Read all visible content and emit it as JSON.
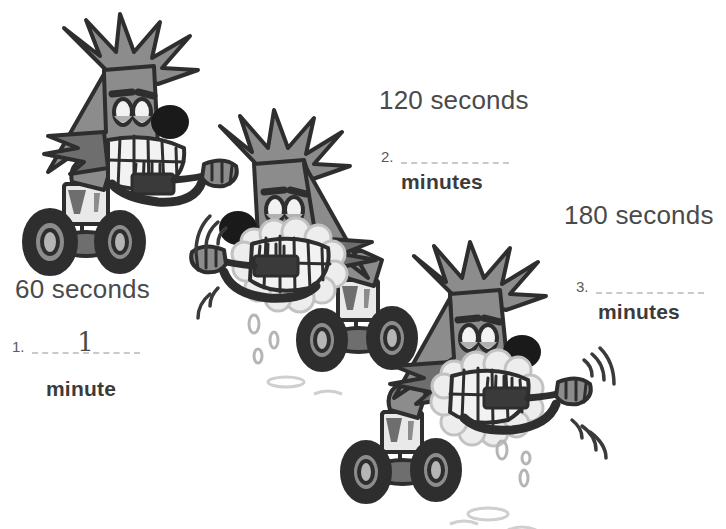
{
  "worksheet": {
    "background_color": "#ffffff",
    "text_color": "#4a4a4a",
    "palette": {
      "body_gray": "#8c8c8c",
      "body_shadow": "#6e6e6e",
      "dark_gray": "#5a5a5a",
      "outline": "#2e2e2e",
      "near_black": "#1a1a1a",
      "tooth_white": "#f2f2f2",
      "foam_white": "#ededed",
      "blank_line": "#c9c9c9",
      "wheel_rim": "#9a9a9a"
    },
    "problems": [
      {
        "seconds_label": "60 seconds",
        "item_number": "1.",
        "answer_value": "1",
        "unit_label": "minute",
        "character": {
          "name": "monster-on-segway-brushing",
          "has_foam": false,
          "has_motion_lines": false,
          "has_water_drops": false
        }
      },
      {
        "seconds_label": "120 seconds",
        "item_number": "2.",
        "answer_value": "",
        "unit_label": "minutes",
        "character": {
          "name": "monster-on-segway-brushing",
          "has_foam": true,
          "has_motion_lines": true,
          "has_water_drops": true
        }
      },
      {
        "seconds_label": "180 seconds",
        "item_number": "3.",
        "answer_value": "",
        "unit_label": "minutes",
        "character": {
          "name": "monster-on-segway-brushing",
          "has_foam": true,
          "has_motion_lines": true,
          "has_water_drops": true
        }
      }
    ]
  }
}
